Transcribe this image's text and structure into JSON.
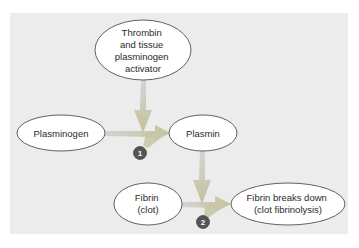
{
  "diagram": {
    "colors": {
      "page_background": "#ffffff",
      "panel_background": "#ececec",
      "node_fill": "#ffffff",
      "node_stroke": "#3a3a3a",
      "arrow_start": "#c9c9c9",
      "arrow_end": "#c8c49a",
      "badge_fill": "#555555",
      "badge_text": "#ffffff"
    },
    "nodes": {
      "thrombin_tpa": {
        "lines": [
          "Thrombin",
          "and tissue",
          "plasminogen",
          "activator"
        ]
      },
      "plasminogen": {
        "lines": [
          "Plasminogen"
        ]
      },
      "plasmin": {
        "lines": [
          "Plasmin"
        ]
      },
      "fibrin": {
        "lines": [
          "Fibrin",
          "(clot)"
        ]
      },
      "fibrin_breakdown": {
        "lines": [
          "Fibrin breaks down",
          "(clot fibrinolysis)"
        ]
      }
    },
    "steps": [
      {
        "number": "1",
        "from": "Plasminogen",
        "to": "Plasmin",
        "catalyst": "Thrombin and tissue plasminogen activator"
      },
      {
        "number": "2",
        "from": "Fibrin (clot)",
        "to": "Fibrin breaks down (clot fibrinolysis)",
        "catalyst": "Plasmin"
      }
    ]
  }
}
